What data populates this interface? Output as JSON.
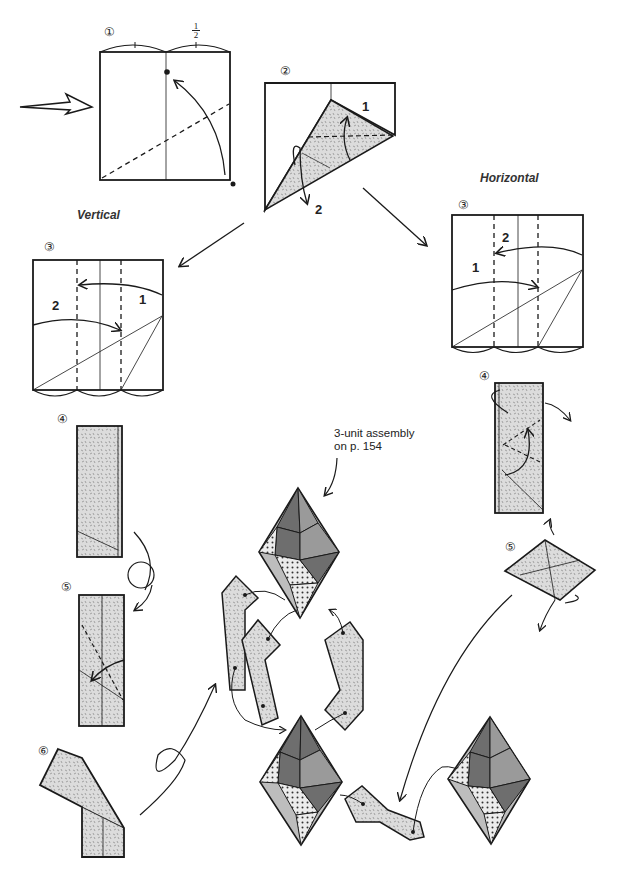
{
  "diagram": {
    "type": "origami-folding-instructions",
    "steps": {
      "s1": {
        "label": "①",
        "fraction_num": "1",
        "fraction_den": "2"
      },
      "s2": {
        "label": "②",
        "fold_1": "1",
        "fold_2": "2"
      },
      "vertical": {
        "heading": "Vertical",
        "s3": {
          "label": "③",
          "fold_1": "1",
          "fold_2": "2"
        },
        "s4": {
          "label": "④"
        },
        "s5": {
          "label": "⑤"
        },
        "s6": {
          "label": "⑥"
        }
      },
      "horizontal": {
        "heading": "Horizontal",
        "s3": {
          "label": "③",
          "fold_1": "1",
          "fold_2": "2"
        },
        "s4": {
          "label": "④"
        },
        "s5": {
          "label": "⑤"
        }
      }
    },
    "assembly_note": {
      "line1": "3-unit assembly",
      "line2": "on p. 154"
    },
    "colors": {
      "line": "#1a1a1a",
      "paper_texture": "#d9d9d9",
      "dark_face": "#6e6e6e",
      "mid_face": "#9a9a9a",
      "light_face": "#bdbdbd",
      "dot_face": "#e6e6e6"
    }
  }
}
